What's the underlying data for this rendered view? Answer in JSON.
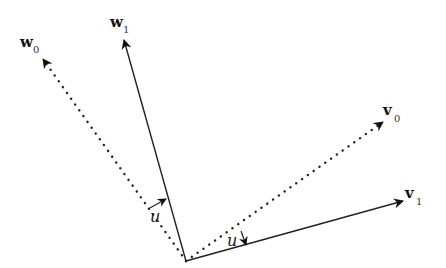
{
  "diagram": {
    "origin": [
      186,
      261
    ],
    "vectors": [
      {
        "id": "w0",
        "name": "w",
        "sub": "0",
        "style": "dotted",
        "tip": [
          43,
          59
        ],
        "label_pos": [
          20,
          47
        ],
        "sub_pos": [
          33,
          53
        ]
      },
      {
        "id": "w1",
        "name": "w",
        "sub": "1",
        "style": "solid",
        "tip": [
          124,
          40
        ],
        "label_pos": [
          110,
          27
        ],
        "sub_pos": [
          123,
          33
        ]
      },
      {
        "id": "v0",
        "name": "v",
        "sub": "0",
        "style": "dotted",
        "tip": [
          383,
          122
        ],
        "label_pos": [
          383,
          115
        ],
        "sub_pos": [
          394,
          122
        ]
      },
      {
        "id": "v1",
        "name": "v",
        "sub": "1",
        "style": "solid",
        "tip": [
          403,
          201
        ],
        "label_pos": [
          405,
          198
        ],
        "sub_pos": [
          416,
          205
        ]
      }
    ],
    "rotation_markers": [
      {
        "label": "u",
        "from": [
          148,
          209
        ],
        "to": [
          166,
          199
        ],
        "label_pos": [
          150,
          222
        ]
      },
      {
        "label": "u",
        "from": [
          241,
          231
        ],
        "to": [
          246,
          245
        ],
        "label_pos": [
          227,
          246
        ]
      }
    ]
  }
}
